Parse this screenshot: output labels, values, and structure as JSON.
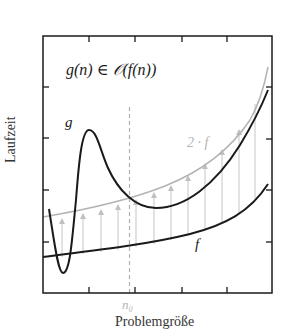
{
  "diagram": {
    "title": "g(n) ∈ 𝒪(f(n))",
    "xlabel": "Problemgröße",
    "ylabel": "Laufzeit",
    "curves": {
      "g": {
        "label": "g",
        "color": "#1a1a1a"
      },
      "two_f": {
        "label": "2 · f",
        "color": "#b3b3b3"
      },
      "f": {
        "label": "f",
        "color": "#1a1a1a"
      }
    },
    "threshold": {
      "label": "n₀",
      "color": "#b3b3b3"
    },
    "arrow_color": "#c8c8c8"
  }
}
